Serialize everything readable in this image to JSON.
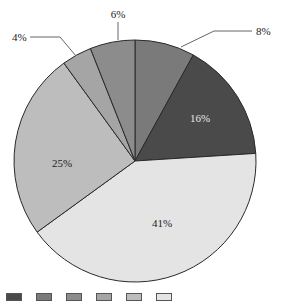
{
  "chart_data": {
    "type": "pie",
    "title": "",
    "start_angle_deg": 0,
    "direction": "clockwise",
    "slices": [
      {
        "label": "8%",
        "value": 8,
        "color": "#7a7a7a",
        "label_position": "outside"
      },
      {
        "label": "16%",
        "value": 16,
        "color": "#4a4a4a",
        "label_position": "inside",
        "label_color": "#e8e8e8"
      },
      {
        "label": "41%",
        "value": 41,
        "color": "#e4e4e4",
        "label_position": "inside",
        "label_color": "#222222"
      },
      {
        "label": "25%",
        "value": 25,
        "color": "#bdbdbd",
        "label_position": "inside",
        "label_color": "#222222"
      },
      {
        "label": "4%",
        "value": 4,
        "color": "#a5a5a5",
        "label_position": "outside"
      },
      {
        "label": "6%",
        "value": 6,
        "color": "#8c8c8c",
        "label_position": "outside"
      }
    ],
    "legend": {
      "position": "bottom",
      "note": "legend is clipped at the bottom edge; category text not legible",
      "swatch_colors": [
        "#4a4a4a",
        "#7a7a7a",
        "#8c8c8c",
        "#a5a5a5",
        "#bdbdbd",
        "#e4e4e4"
      ]
    }
  },
  "labels": {
    "s0": "8%",
    "s1": "16%",
    "s2": "41%",
    "s3": "25%",
    "s4": "4%",
    "s5": "6%"
  }
}
